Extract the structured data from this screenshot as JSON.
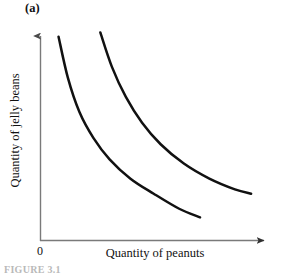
{
  "figure": {
    "panel_label": "(a)",
    "caption": "FIGURE 3.1",
    "origin_label": "0",
    "background_color": "#ffffff",
    "axis_color": "#6e6e6e",
    "curve_color": "#111111"
  },
  "axes": {
    "x_title": "Quantity of peanuts",
    "y_title": "Quantity of jelly beans"
  },
  "chart_data": {
    "type": "line",
    "title": "(a)",
    "xlabel": "Quantity of peanuts",
    "ylabel": "Quantity of jelly beans",
    "grid": false,
    "legend": "none",
    "xlim": [
      0,
      10
    ],
    "ylim": [
      0,
      10
    ],
    "axis_ticks": {
      "x": [
        "0"
      ],
      "y": []
    },
    "annotations": [
      "(a)"
    ],
    "series": [
      {
        "name": "indifference curve 1",
        "color": "#111111",
        "x": [
          0.8,
          1.2,
          1.7,
          2.3,
          3.0,
          3.9,
          4.9,
          6.0,
          6.9
        ],
        "y": [
          9.5,
          7.6,
          6.0,
          4.8,
          3.8,
          2.9,
          2.2,
          1.5,
          1.1
        ]
      },
      {
        "name": "indifference curve 2",
        "color": "#111111",
        "x": [
          2.6,
          3.1,
          3.7,
          4.4,
          5.2,
          6.2,
          7.3,
          8.4,
          9.1
        ],
        "y": [
          9.7,
          8.1,
          6.7,
          5.5,
          4.5,
          3.6,
          2.9,
          2.4,
          2.2
        ]
      }
    ]
  }
}
